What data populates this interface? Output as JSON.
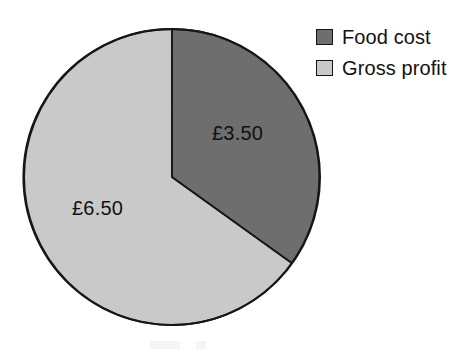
{
  "chart_data": {
    "type": "pie",
    "title": "",
    "currency_symbol": "£",
    "total": 10.0,
    "categories": [
      "Food cost",
      "Gross profit"
    ],
    "values": [
      3.5,
      6.5
    ],
    "percentages": [
      35,
      65
    ],
    "data_labels": [
      "£3.50",
      "£6.50"
    ],
    "colors": [
      "#6e6e6e",
      "#c9c9c9"
    ],
    "outline_color": "#161616",
    "start_angle_deg": 0,
    "slice_angles_deg": [
      126,
      234
    ],
    "legend_position": "top-right",
    "grid": false,
    "xlabel": "",
    "ylabel": ""
  },
  "chart": {
    "geometry": {
      "center_x": 172,
      "center_y": 177,
      "radius": 148
    },
    "slices": [
      {
        "name": "food-cost",
        "label": "£3.50",
        "value": 3.5,
        "color": "#6e6e6e",
        "path": "M 172 177 L 172 29 A 148 148 0 0 1 291.76 262.99 Z"
      },
      {
        "name": "gross-profit",
        "label": "£6.50",
        "value": 6.5,
        "color": "#c9c9c9",
        "path": "M 172 177 L 291.76 262.99 A 148 148 0 1 1 172 29 Z"
      }
    ]
  },
  "legend": {
    "items": [
      {
        "label": "Food cost",
        "color": "#6e6e6e",
        "swatch_name": "legend-swatch-food-cost"
      },
      {
        "label": "Gross profit",
        "color": "#c9c9c9",
        "swatch_name": "legend-swatch-gross-profit"
      }
    ]
  }
}
